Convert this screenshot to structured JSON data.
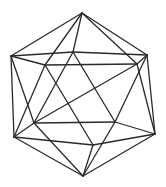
{
  "figure": {
    "stroke_color": "#2a2a2a",
    "background": "#ffffff",
    "vertices": {
      "T": [
        82,
        13
      ],
      "LU": [
        11,
        56
      ],
      "RU": [
        147,
        55
      ],
      "IM": [
        73,
        52
      ],
      "IL": [
        45,
        65
      ],
      "IR": [
        137,
        64
      ],
      "ML": [
        34,
        123
      ],
      "MR": [
        115,
        122
      ],
      "LL": [
        14,
        137
      ],
      "RL": [
        155,
        134
      ],
      "BM": [
        93,
        145
      ],
      "B": [
        83,
        176
      ]
    },
    "edges": [
      [
        "T",
        "LU"
      ],
      [
        "T",
        "RU"
      ],
      [
        "T",
        "IM"
      ],
      [
        "T",
        "IL"
      ],
      [
        "T",
        "IR"
      ],
      [
        "LU",
        "IM"
      ],
      [
        "IM",
        "RU"
      ],
      [
        "LU",
        "IL"
      ],
      [
        "IL",
        "IR"
      ],
      [
        "IR",
        "RU"
      ],
      [
        "LU",
        "LL"
      ],
      [
        "LU",
        "ML"
      ],
      [
        "RU",
        "RL"
      ],
      [
        "RU",
        "MR"
      ],
      [
        "IM",
        "ML"
      ],
      [
        "IM",
        "MR"
      ],
      [
        "IL",
        "LL"
      ],
      [
        "IL",
        "BM"
      ],
      [
        "IR",
        "ML"
      ],
      [
        "IR",
        "RL"
      ],
      [
        "ML",
        "MR"
      ],
      [
        "ML",
        "LL"
      ],
      [
        "MR",
        "RL"
      ],
      [
        "LL",
        "BM"
      ],
      [
        "BM",
        "RL"
      ],
      [
        "LL",
        "B"
      ],
      [
        "BM",
        "B"
      ],
      [
        "RL",
        "B"
      ],
      [
        "ML",
        "B"
      ],
      [
        "MR",
        "B"
      ]
    ]
  }
}
